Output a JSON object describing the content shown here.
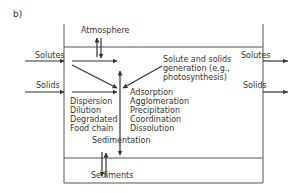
{
  "panel_label": "b)",
  "compartments": {
    "atmosphere": "Atmosphere",
    "sediments": "Sediments"
  },
  "inputs": {
    "solutes": "Solutes",
    "solids": "Solids"
  },
  "outputs": {
    "solutes": "Solutes",
    "solids": "Solids"
  },
  "generation_label": [
    "Solute and solids",
    "generation (e.g.,",
    "photosynthesis)"
  ],
  "left_processes": [
    "Dispersion",
    "Dilution",
    "Degradated",
    "Food chain"
  ],
  "right_processes": [
    "Adsorption",
    "Agglomeration",
    "Precipitation",
    "Coordination",
    "Dissolution"
  ],
  "sedimentation_label": "Sedimentation",
  "colors": {
    "line": "#555555",
    "arrow": "#333333",
    "text": "#333333",
    "background": "#ffffff"
  }
}
